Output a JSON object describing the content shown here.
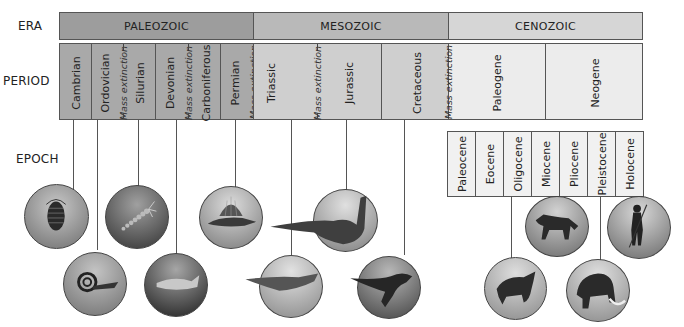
{
  "labels": {
    "era": "ERA",
    "period": "PERIOD",
    "epoch": "EPOCH"
  },
  "eras": [
    {
      "name": "PALEOZOIC",
      "color": "#9d9d9d"
    },
    {
      "name": "MESOZOIC",
      "color": "#b9b9b9"
    },
    {
      "name": "CENOZOIC",
      "color": "#d6d6d6"
    }
  ],
  "periods": [
    {
      "name": "Cambrian",
      "era": "PALEOZOIC"
    },
    {
      "name": "Ordovician",
      "era": "PALEOZOIC"
    },
    {
      "name": "Silurian",
      "era": "PALEOZOIC"
    },
    {
      "name": "Devonian",
      "era": "PALEOZOIC"
    },
    {
      "name": "Carboniferous",
      "era": "PALEOZOIC"
    },
    {
      "name": "Permian",
      "era": "PALEOZOIC"
    },
    {
      "name": "Triassic",
      "era": "MESOZOIC"
    },
    {
      "name": "Jurassic",
      "era": "MESOZOIC"
    },
    {
      "name": "Cretaceous",
      "era": "MESOZOIC"
    },
    {
      "name": "Paleogene",
      "era": "CENOZOIC"
    },
    {
      "name": "Neogene",
      "era": "CENOZOIC"
    }
  ],
  "mass_extinction_label": "Mass extinction",
  "mass_extinctions": [
    {
      "after": "Ordovician"
    },
    {
      "after": "Devonian"
    },
    {
      "after": "Permian"
    },
    {
      "after": "Triassic"
    },
    {
      "after": "Cretaceous"
    }
  ],
  "epochs": [
    {
      "name": "Paleocene"
    },
    {
      "name": "Eocene"
    },
    {
      "name": "Oligocene"
    },
    {
      "name": "Miocene"
    },
    {
      "name": "Pliocene"
    },
    {
      "name": "Pleistocene"
    },
    {
      "name": "Holocene"
    }
  ],
  "illustrations": [
    {
      "subject": "trilobite",
      "period": "Cambrian"
    },
    {
      "subject": "ammonoid-nautiloid",
      "period": "Ordovician"
    },
    {
      "subject": "sea-scorpion",
      "period": "Silurian"
    },
    {
      "subject": "armored-fish",
      "period": "Devonian"
    },
    {
      "subject": "dimetrodon",
      "period": "Permian"
    },
    {
      "subject": "early-dinosaur",
      "period": "Triassic"
    },
    {
      "subject": "sauropod",
      "period": "Jurassic"
    },
    {
      "subject": "theropod",
      "period": "Cretaceous"
    },
    {
      "subject": "rhinoceros",
      "epoch": "Oligocene"
    },
    {
      "subject": "horse",
      "epoch": "Miocene"
    },
    {
      "subject": "mammoth",
      "epoch": "Pleistocene"
    },
    {
      "subject": "human",
      "epoch": "Holocene"
    }
  ],
  "colors": {
    "paleozoic_period": "#a9a9a9",
    "mesozoic_period": "#cfcfcf",
    "cenozoic_period": "#ececec",
    "border": "#555555"
  }
}
